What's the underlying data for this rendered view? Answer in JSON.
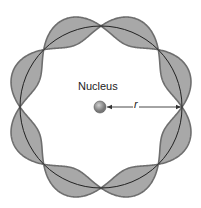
{
  "diagram": {
    "nucleus_label": "Nucleus",
    "radius_label": "r",
    "center": [
      101,
      107
    ],
    "radius": 81,
    "amplitude": 14,
    "wavelengths": 4,
    "colors": {
      "wave_fill": "#a8a8a8",
      "wave_stroke": "#6e6e6e",
      "orbit": "#222222",
      "nucleus": "#777777",
      "arrow": "#333333"
    }
  }
}
